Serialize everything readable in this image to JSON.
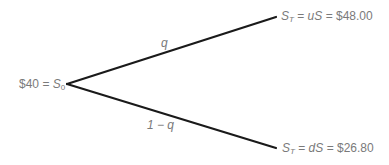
{
  "diagram": {
    "type": "binomial-tree",
    "root": {
      "price": "$40",
      "symbol": "S",
      "subscript": "0"
    },
    "branches": [
      {
        "id": "up",
        "probability_label": "q",
        "terminal": {
          "symbol": "S",
          "subscript": "T",
          "factor_expr": "uS",
          "value": "$48.00"
        }
      },
      {
        "id": "down",
        "probability_label": "1 − q",
        "terminal": {
          "symbol": "S",
          "subscript": "T",
          "factor_expr": "dS",
          "value": "$26.80"
        }
      }
    ],
    "equals": "=",
    "colors": {
      "line": "#1a1a1a",
      "text": "#7a7a7a",
      "background": "#ffffff"
    }
  }
}
